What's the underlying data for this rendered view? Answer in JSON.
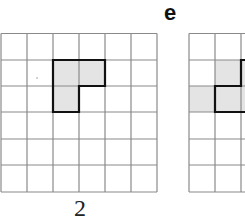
{
  "figure": {
    "panel_number_label": "2",
    "panel_letter_label": "e",
    "grid_left": {
      "rows": 6,
      "cols": 6,
      "cell_size_px": 26.2,
      "shaded_cells": [
        [
          1,
          2
        ],
        [
          1,
          3
        ],
        [
          2,
          2
        ]
      ],
      "shape": "L-tromino"
    },
    "grid_right": {
      "rows": 6,
      "cols": 6,
      "visible_cols": 2,
      "shaded_cells": [
        [
          1,
          2
        ],
        [
          2,
          1
        ],
        [
          2,
          2
        ]
      ],
      "shape": "L-tromino (partially visible)"
    },
    "colors": {
      "grid_line": "#8a8a8a",
      "shape_outline": "#111111",
      "shade": "#e4e4e4"
    }
  }
}
